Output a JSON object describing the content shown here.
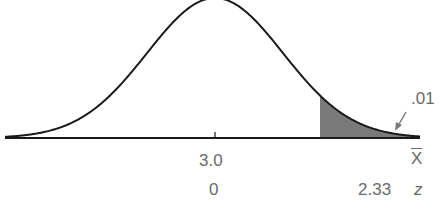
{
  "chart_data": {
    "type": "area",
    "title": "",
    "distribution": "normal",
    "mean_x": "3.0",
    "mean_z": "0",
    "critical_z": "2.33",
    "tail_area": ".01",
    "tail": "right",
    "xlabel": "X̄",
    "zlabel": "z",
    "x_tick_labels": [
      "3.0"
    ],
    "z_tick_labels": [
      "0",
      "2.33"
    ],
    "grid": false,
    "shaded_region": {
      "from_z": 2.33,
      "to_z": "right tail end",
      "area": 0.01
    },
    "colors": {
      "curve": "#1a1a1a",
      "axis": "#1a1a1a",
      "shade": "#7a7a7a",
      "text": "#6a6a6a"
    }
  },
  "labels": {
    "tail_area": ".01",
    "mean_x": "3.0",
    "mean_z": "0",
    "critical_z": "2.33",
    "x_axis": "X",
    "z_axis": "z"
  }
}
